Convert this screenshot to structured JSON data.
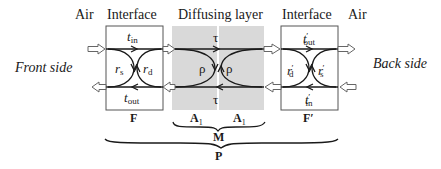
{
  "header": {
    "air_left": "Air",
    "interface_left": "Interface",
    "diffusing_layer": "Diffusing layer",
    "interface_right": "Interface",
    "air_right": "Air"
  },
  "sides": {
    "front": "Front side",
    "back": "Back side"
  },
  "front_interface": {
    "t_in": {
      "base": "t",
      "sub": "in"
    },
    "t_out": {
      "base": "t",
      "sub": "out"
    },
    "r_s": {
      "base": "r",
      "sub": "s"
    },
    "r_d": {
      "base": "r",
      "sub": "d"
    },
    "label": "F"
  },
  "diffusing": {
    "tau_top": "τ",
    "tau_bottom": "τ",
    "rho_left": "ρ",
    "rho_right": "ρ",
    "label_left": "A",
    "label_left_sub": "1",
    "label_right": "A",
    "label_right_sub": "1"
  },
  "back_interface": {
    "t_out": {
      "base": "t",
      "sub": "out",
      "prime": "′"
    },
    "t_in": {
      "base": "t",
      "sub": "in",
      "prime": "′"
    },
    "r_d": {
      "base": "r",
      "sub": "d",
      "prime": "′"
    },
    "r_s": {
      "base": "r",
      "sub": "s",
      "prime": "′"
    },
    "label": "F′"
  },
  "braces": {
    "middle": "M",
    "outer": "P"
  },
  "colors": {
    "diffusing_fill": "#d9d9d9",
    "line": "#1a1a1a",
    "box_border": "#555555"
  }
}
